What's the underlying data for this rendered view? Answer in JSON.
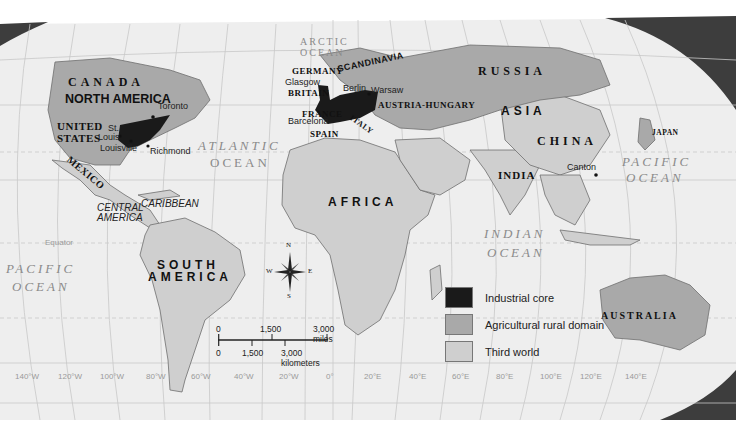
{
  "map": {
    "legend": {
      "items": [
        {
          "label": "Industrial core",
          "color": "#1a1a1a"
        },
        {
          "label": "Agricultural rural domain",
          "color": "#a9a9a9"
        },
        {
          "label": "Third world",
          "color": "#cfcfcf"
        }
      ]
    },
    "colors": {
      "background": "#ffffff",
      "ocean": "#eeeeee",
      "graticule": "#c8c8c8",
      "industrial_core": "#1a1a1a",
      "agricultural": "#a9a9a9",
      "third_world": "#cfcfcf",
      "border": "#6f6f6f",
      "globe_shadow": "#3d3d3d"
    },
    "regions": {
      "canada": "CANADA",
      "north_america": "NORTH AMERICA",
      "united_states_1": "UNITED",
      "united_states_2": "STATES",
      "mexico": "MEXICO",
      "central_america_1": "CENTRAL",
      "central_america_2": "AMERICA",
      "caribbean": "CARIBBEAN",
      "south_america_1": "SOUTH",
      "south_america_2": "AMERICA",
      "germany": "GERMANY",
      "scandinavia": "SCANDINAVIA",
      "britain": "BRITAIN",
      "france": "FRANCE",
      "spain": "SPAIN",
      "italy": "ITALY",
      "europe": "EUROPE",
      "austria_hungary": "AUSTRIA-HUNGARY",
      "russia": "RUSSIA",
      "asia": "ASIA",
      "china": "CHINA",
      "japan": "JAPAN",
      "india": "INDIA",
      "africa": "AFRICA",
      "australia": "AUSTRALIA"
    },
    "cities": {
      "toronto": "Toronto",
      "st_louis_1": "St.",
      "st_louis_2": "Louis",
      "louisville": "Louisville",
      "richmond": "Richmond",
      "glasgow": "Glasgow",
      "berlin": "Berlin",
      "warsaw": "Warsaw",
      "barcelona": "Barcelona",
      "canton": "Canton"
    },
    "oceans": {
      "arctic_1": "ARCTIC",
      "arctic_2": "OCEAN",
      "atlantic_1": "ATLANTIC",
      "atlantic_2": "OCEAN",
      "pacific_w_1": "PACIFIC",
      "pacific_w_2": "OCEAN",
      "pacific_e_1": "PACIFIC",
      "pacific_e_2": "OCEAN",
      "indian_1": "INDIAN",
      "indian_2": "OCEAN"
    },
    "equator_label": "Equator",
    "longitudes": [
      "140°W",
      "120°W",
      "100°W",
      "80°W",
      "60°W",
      "40°W",
      "20°W",
      "0°",
      "20°E",
      "40°E",
      "60°E",
      "80°E",
      "100°E",
      "120°E",
      "140°E"
    ],
    "compass": {
      "n": "N",
      "s": "S",
      "e": "E",
      "w": "W"
    },
    "scale": {
      "miles_0": "0",
      "miles_mid": "1,500",
      "miles_max": "3,000 miles",
      "km_0": "0",
      "km_mid": "1,500",
      "km_max": "3,000 kilometers"
    }
  }
}
